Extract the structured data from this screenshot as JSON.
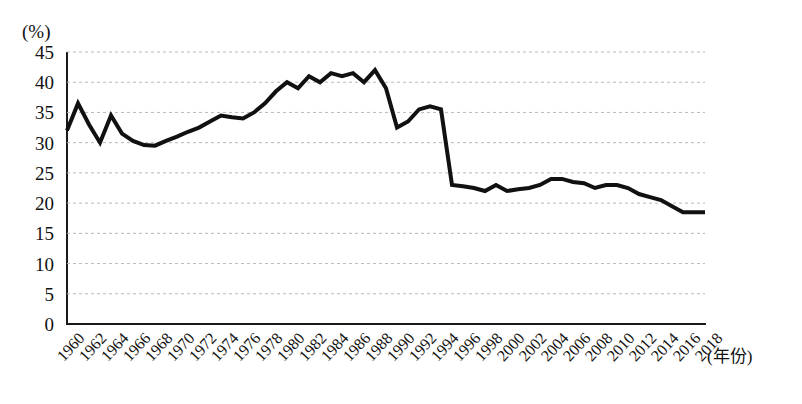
{
  "chart_data": {
    "type": "line",
    "title": "",
    "subtitle": "",
    "xlabel": "(年份)",
    "ylabel": "(%)",
    "y_unit": "(%)",
    "ylim": [
      0,
      45
    ],
    "xlim": [
      1960,
      2018
    ],
    "y_ticks": [
      45,
      40,
      35,
      30,
      25,
      20,
      15,
      10,
      5,
      0
    ],
    "y_tick_step": 5,
    "x_ticks": [
      "1960",
      "1962",
      "1964",
      "1966",
      "1968",
      "1970",
      "1972",
      "1974",
      "1976",
      "1978",
      "1980",
      "1982",
      "1984",
      "1986",
      "1988",
      "1990",
      "1992",
      "1994",
      "1996",
      "1998",
      "2000",
      "2002",
      "2004",
      "2006",
      "2008",
      "2010",
      "2012",
      "2014",
      "2016",
      "2018"
    ],
    "x_tick_step": 2,
    "grid": "horizontal-dashed",
    "legend": "none",
    "line_color": "#111111",
    "line_width": 4,
    "x": [
      1960,
      1961,
      1962,
      1963,
      1964,
      1965,
      1966,
      1967,
      1968,
      1969,
      1970,
      1971,
      1972,
      1973,
      1974,
      1975,
      1976,
      1977,
      1978,
      1979,
      1980,
      1981,
      1982,
      1983,
      1984,
      1985,
      1986,
      1987,
      1988,
      1989,
      1990,
      1991,
      1992,
      1993,
      1994,
      1995,
      1996,
      1997,
      1998,
      1999,
      2000,
      2001,
      2002,
      2003,
      2004,
      2005,
      2006,
      2007,
      2008,
      2009,
      2010,
      2011,
      2012,
      2013,
      2014,
      2015,
      2016,
      2017,
      2018
    ],
    "values": [
      32.0,
      36.5,
      33.0,
      30.0,
      34.5,
      31.5,
      30.3,
      29.6,
      29.5,
      30.3,
      31.0,
      31.8,
      32.5,
      33.5,
      34.5,
      34.2,
      34.0,
      35.0,
      36.5,
      38.5,
      40.0,
      39.0,
      41.0,
      40.0,
      41.5,
      41.0,
      41.5,
      40.0,
      42.0,
      39.0,
      32.5,
      33.5,
      35.5,
      36.0,
      35.5,
      23.0,
      22.8,
      22.5,
      22.0,
      23.0,
      22.0,
      22.3,
      22.5,
      23.0,
      24.0,
      24.0,
      23.5,
      23.3,
      22.5,
      23.0,
      23.0,
      22.5,
      21.5,
      21.0,
      20.5,
      19.5,
      18.5,
      18.5,
      18.5
    ],
    "series": [
      {
        "name": "",
        "values": [
          32.0,
          36.5,
          33.0,
          30.0,
          34.5,
          31.5,
          30.3,
          29.6,
          29.5,
          30.3,
          31.0,
          31.8,
          32.5,
          33.5,
          34.5,
          34.2,
          34.0,
          35.0,
          36.5,
          38.5,
          40.0,
          39.0,
          41.0,
          40.0,
          41.5,
          41.0,
          41.5,
          40.0,
          42.0,
          39.0,
          32.5,
          33.5,
          35.5,
          36.0,
          35.5,
          23.0,
          22.8,
          22.5,
          22.0,
          23.0,
          22.0,
          22.3,
          22.5,
          23.0,
          24.0,
          24.0,
          23.5,
          23.3,
          22.5,
          23.0,
          23.0,
          22.5,
          21.5,
          21.0,
          20.5,
          19.5,
          18.5,
          18.5,
          18.5
        ]
      }
    ]
  }
}
